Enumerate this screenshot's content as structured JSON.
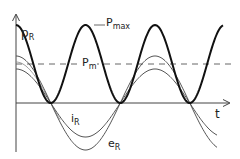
{
  "labels": {
    "p_r": {
      "main": "p",
      "sub": "R"
    },
    "p_max": {
      "main": "P",
      "sub": "max"
    },
    "p_m": {
      "main": "P",
      "sub": "m"
    },
    "i_r": {
      "main": "i",
      "sub": "R"
    },
    "e_r": {
      "main": "e",
      "sub": "R"
    },
    "t_axis": "t"
  },
  "colors": {
    "power_curve": "#111111",
    "thin_curves": "#555555",
    "axis": "#444444",
    "mean_line": "#555555"
  },
  "geometry": {
    "origin_x": 16,
    "axis_y": 103,
    "power_peak_y": 25,
    "mean_y": 64,
    "period_px": 139,
    "e_amplitude_px": 47,
    "i_amplitude_px": 34
  }
}
